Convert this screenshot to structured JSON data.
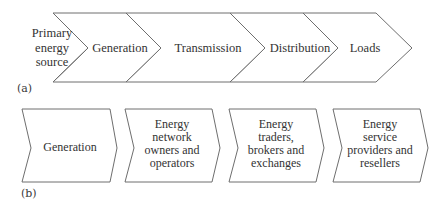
{
  "panel_a": {
    "label": "(a)",
    "stages": [
      {
        "lines": [
          "Primary",
          "energy",
          "source"
        ]
      },
      {
        "lines": [
          "Generation"
        ]
      },
      {
        "lines": [
          "Transmission"
        ]
      },
      {
        "lines": [
          "Distribution"
        ]
      },
      {
        "lines": [
          "Loads"
        ]
      }
    ]
  },
  "panel_b": {
    "label": "(b)",
    "stages": [
      {
        "lines": [
          "Generation"
        ]
      },
      {
        "lines": [
          "Energy",
          "network",
          "owners and",
          "operators"
        ]
      },
      {
        "lines": [
          "Energy",
          "traders,",
          "brokers and",
          "exchanges"
        ]
      },
      {
        "lines": [
          "Energy",
          "service",
          "providers and",
          "resellers"
        ]
      }
    ]
  },
  "colors": {
    "stroke": "#6e6e6e",
    "text": "#333333",
    "background": "#ffffff"
  }
}
